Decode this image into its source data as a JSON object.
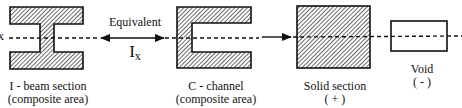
{
  "diagram": {
    "axis_label": "x",
    "equivalent_label": "Equivalent",
    "moment_symbol": "I",
    "moment_subscript": "x",
    "shapes": [
      {
        "id": "i-beam",
        "line1": "I - beam section",
        "line2": "(composite area)"
      },
      {
        "id": "c-channel",
        "line1": "C - channel",
        "line2": "(composite area)"
      },
      {
        "id": "solid",
        "line1": "Solid section",
        "line2": "( + )"
      },
      {
        "id": "void",
        "line1": "Void",
        "line2": "( - )"
      }
    ],
    "colors": {
      "stroke": "#111111",
      "hatch": "#555555",
      "fill": "#ffffff"
    }
  }
}
